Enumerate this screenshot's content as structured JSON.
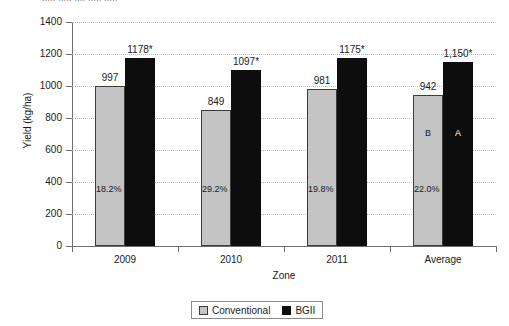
{
  "top_partial_text": "..... .....   ....  .....    .....",
  "chart_data": {
    "type": "bar",
    "title": "",
    "xlabel": "Zone",
    "ylabel": "Yield (kg/ha)",
    "ylim": [
      0,
      1400
    ],
    "ytick_step": 200,
    "yticks": [
      1400,
      1200,
      1000,
      800,
      600,
      400,
      200,
      0
    ],
    "grid": true,
    "legend_position": "bottom-center",
    "categories": [
      "2009",
      "2010",
      "2011",
      "Average"
    ],
    "series": [
      {
        "name": "Conventional",
        "color": "#c4c4c4",
        "values": [
          997,
          849,
          981,
          942
        ],
        "labels": [
          "997",
          "849",
          "981",
          "942"
        ]
      },
      {
        "name": "BGII",
        "color": "#0d0d0d",
        "values": [
          1178,
          1097,
          1175,
          1150
        ],
        "labels": [
          "1178*",
          "1097*",
          "1175*",
          "1,150*"
        ]
      }
    ],
    "annotations": {
      "percent_increase": [
        "18.2%",
        "29.2%",
        "19.8%",
        "22.0%"
      ],
      "average_group_letters": {
        "conventional": "B",
        "bgii": "A"
      }
    }
  },
  "legend": {
    "items": [
      {
        "label": "Conventional",
        "swatch": "conventional"
      },
      {
        "label": "BGII",
        "swatch": "bgii"
      }
    ]
  }
}
